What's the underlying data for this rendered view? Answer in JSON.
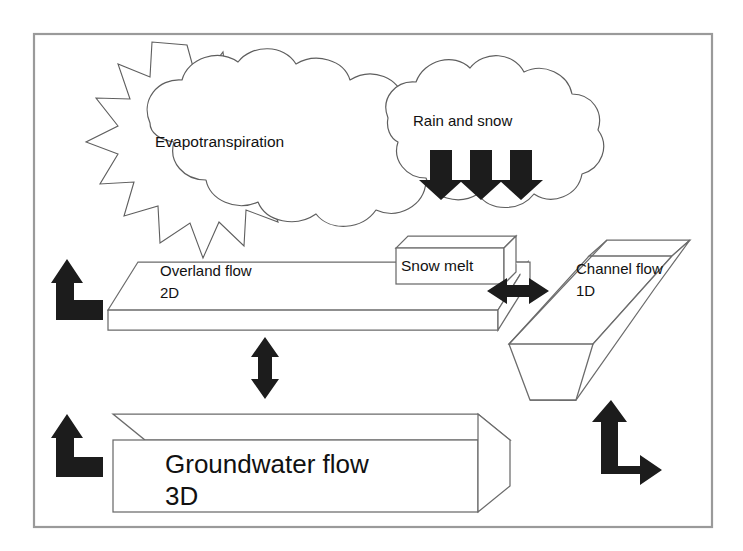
{
  "diagram": {
    "frame": {
      "x": 33,
      "y": 33,
      "width": 679,
      "height": 494
    },
    "colors": {
      "background": "#ffffff",
      "frame_stroke": "#9a9a9a",
      "outline_stroke": "#5e5e5e",
      "box_stroke": "#6b6b6b",
      "arrow_fill": "#1c1c1c",
      "text": "#111111"
    },
    "labels": {
      "evapotranspiration": "Evapotranspiration",
      "rain_and_snow": "Rain and snow",
      "snow_melt": "Snow melt",
      "overland_flow": "Overland flow",
      "overland_flow_dim": "2D",
      "channel_flow": "Channel flow",
      "channel_flow_dim": "1D",
      "groundwater_flow": "Groundwater flow",
      "groundwater_flow_dim": "3D"
    },
    "icons": {
      "sun_burst": "sun-burst-icon",
      "cloud_left": "cloud-icon",
      "cloud_right": "cloud-icon",
      "rain_arrow": "arrow-down-icon",
      "evaporation_arrow": "bent-arrow-up-icon",
      "exchange_vertical": "double-arrow-vertical-icon",
      "exchange_horizontal": "double-arrow-horizontal-icon",
      "baseflow_arrow": "bent-double-arrow-icon"
    },
    "components": [
      {
        "id": "evapotranspiration",
        "name": "Evapotranspiration",
        "kind": "cloud-with-sun",
        "label_position": {
          "x": 155,
          "y": 147
        }
      },
      {
        "id": "rain-and-snow",
        "name": "Rain and snow",
        "kind": "cloud",
        "label_position": {
          "x": 413,
          "y": 126
        },
        "arrow_count": 3
      },
      {
        "id": "snow-melt",
        "name": "Snow melt",
        "kind": "box-3d",
        "label_position": {
          "x": 401,
          "y": 270
        }
      },
      {
        "id": "overland-flow",
        "name": "Overland flow",
        "dimension": "2D",
        "kind": "slab-3d",
        "label_position": {
          "x": 160,
          "y": 275
        }
      },
      {
        "id": "channel-flow",
        "name": "Channel flow",
        "dimension": "1D",
        "kind": "trapezoidal-channel-3d",
        "label_position": {
          "x": 576,
          "y": 273
        }
      },
      {
        "id": "groundwater-flow",
        "name": "Groundwater flow",
        "dimension": "3D",
        "kind": "box-3d",
        "label_position": {
          "x": 165,
          "y": 464
        }
      }
    ],
    "flows": [
      {
        "id": "evaporation-from-overland",
        "icon": "bent-arrow-up-icon",
        "direction": "up"
      },
      {
        "id": "evaporation-from-groundwater",
        "icon": "bent-arrow-up-icon",
        "direction": "up"
      },
      {
        "id": "precipitation",
        "icon": "arrow-down-icon",
        "direction": "down",
        "count": 3
      },
      {
        "id": "overland-groundwater-exchange",
        "icon": "double-arrow-vertical-icon",
        "direction": "both"
      },
      {
        "id": "overland-channel-exchange",
        "icon": "double-arrow-horizontal-icon",
        "direction": "both"
      },
      {
        "id": "groundwater-channel-exchange",
        "icon": "bent-double-arrow-icon",
        "direction": "both"
      }
    ]
  }
}
